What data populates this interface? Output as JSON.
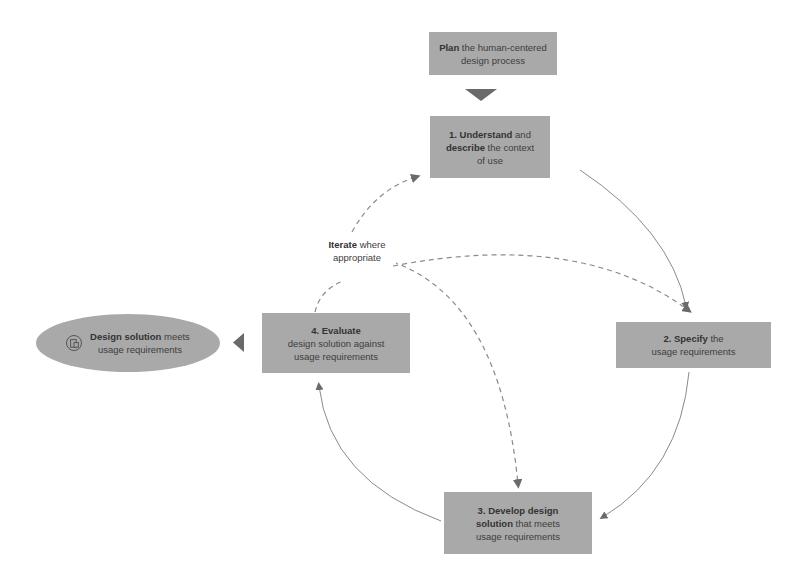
{
  "diagram": {
    "plan": {
      "bold": "Plan",
      "rest_line1": " the human-centered",
      "line2": "design process"
    },
    "step1": {
      "bold1": "1. Understand",
      "mid": " and",
      "bold2": "describe",
      "rest": " the context",
      "line3": "of use"
    },
    "step2": {
      "bold": "2. Specify",
      "rest": " the",
      "line2": "usage requirements"
    },
    "step3": {
      "bold1": "3. Develop design",
      "bold2": "solution",
      "rest": " that meets",
      "line3": "usage requirements"
    },
    "step4": {
      "bold": "4. Evaluate",
      "line2": "design solution against",
      "line3": "usage requirements"
    },
    "outcome": {
      "bold": "Design solution",
      "rest": " meets",
      "line2": "usage requirements",
      "icon": "device-icon"
    },
    "iterate": {
      "bold": "Iterate",
      "rest": " where",
      "line2": "appropriate"
    },
    "colors": {
      "box": "#a9a9a9",
      "arrow": "#6e6e6e",
      "dashed": "#8a8a8a",
      "background": "#ffffff"
    }
  }
}
